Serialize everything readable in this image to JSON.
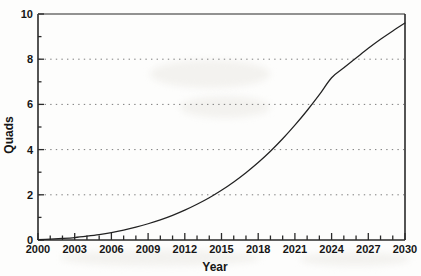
{
  "chart_data": {
    "type": "line",
    "title": "",
    "xlabel": "Year",
    "ylabel": "Quads",
    "xlim": [
      2000,
      2030
    ],
    "ylim": [
      0,
      10
    ],
    "grid": "horizontal-dotted",
    "legend": "none",
    "x_major_ticks": [
      2000,
      2003,
      2006,
      2009,
      2012,
      2015,
      2018,
      2021,
      2024,
      2027,
      2030
    ],
    "x_minor_tick_interval": 1,
    "y_major_ticks": [
      0,
      2,
      4,
      6,
      8,
      10
    ],
    "y_minor_ticks": [
      1,
      3,
      5,
      7,
      9
    ],
    "gridline_values": [
      2,
      4,
      6,
      8
    ],
    "xtick_labels": [
      "2000",
      "2003",
      "2006",
      "2009",
      "2012",
      "2015",
      "2018",
      "2021",
      "2024",
      "2027",
      "2030"
    ],
    "ytick_labels": [
      "0",
      "2",
      "4",
      "6",
      "8",
      "10"
    ],
    "series": [
      {
        "name": "Quads",
        "color": "#222222",
        "style": "solid",
        "x": [
          2000,
          2001,
          2002,
          2003,
          2004,
          2005,
          2006,
          2007,
          2008,
          2009,
          2010,
          2011,
          2012,
          2013,
          2014,
          2015,
          2016,
          2017,
          2018,
          2019,
          2020,
          2021,
          2022,
          2023,
          2024,
          2025,
          2026,
          2027,
          2028,
          2029,
          2030
        ],
        "values": [
          0.02,
          0.04,
          0.07,
          0.11,
          0.17,
          0.24,
          0.33,
          0.44,
          0.57,
          0.72,
          0.89,
          1.09,
          1.32,
          1.58,
          1.87,
          2.2,
          2.57,
          2.98,
          3.43,
          3.93,
          4.48,
          5.08,
          5.73,
          6.43,
          7.18,
          7.62,
          8.05,
          8.48,
          8.88,
          9.25,
          9.6
        ]
      }
    ],
    "crossings": [
      {
        "value": 2,
        "year": 2014.6
      },
      {
        "value": 4,
        "year": 2020.5
      },
      {
        "value": 6,
        "year": 2024.4
      },
      {
        "value": 8,
        "year": 2027.9
      }
    ]
  }
}
